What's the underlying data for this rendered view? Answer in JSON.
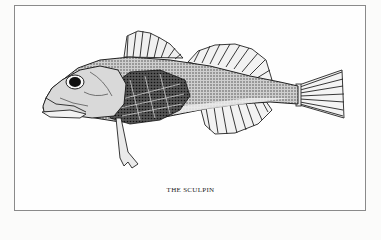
{
  "illustration": {
    "subject": "sculpin-fish",
    "caption": "THE SCULPIN",
    "style": "black-and-white engraving"
  },
  "colors": {
    "background": "#fbfbfa",
    "frame_border": "#8a8a8a",
    "ink": "#1c1c1c"
  }
}
